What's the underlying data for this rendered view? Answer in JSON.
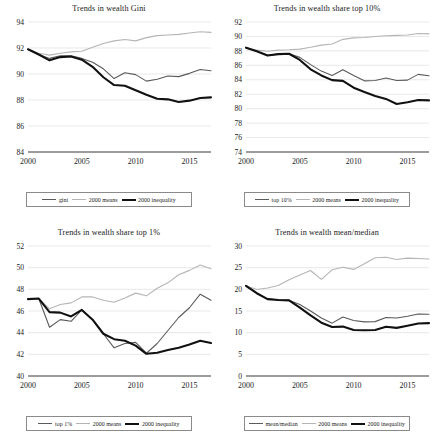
{
  "figure": {
    "width": 436,
    "height": 448,
    "background": "#ffffff",
    "layout": "2x2-grid-of-line-charts"
  },
  "styles": {
    "series_color": "#5a5a5a",
    "means_color": "#b5b5b5",
    "inequality_color": "#111111",
    "grid_color": "#d9d9d9",
    "axis_color": "#3a3a3a",
    "legend_border": "#8a8a8a"
  },
  "charts": [
    {
      "id": "wealth-gini",
      "type": "line",
      "title": "Trends in wealth Gini",
      "xlabel": "",
      "ylabel": "",
      "grid": true,
      "legend_position": "below-axis",
      "xlim": [
        2000,
        2017
      ],
      "ylim": [
        84,
        94
      ],
      "yticks": [
        84,
        86,
        88,
        90,
        92,
        94
      ],
      "xticks": [
        2000,
        2005,
        2010,
        2015
      ],
      "x": [
        2000,
        2001,
        2002,
        2003,
        2004,
        2005,
        2006,
        2007,
        2008,
        2009,
        2010,
        2011,
        2012,
        2013,
        2014,
        2015,
        2016,
        2017
      ],
      "series": [
        {
          "name": "gini",
          "color": "#5a5a5a",
          "width": 1.1,
          "values": [
            91.9,
            91.5,
            91.2,
            91.4,
            91.4,
            91.2,
            90.9,
            90.4,
            89.65,
            90.1,
            89.95,
            89.45,
            89.6,
            89.85,
            89.8,
            90.05,
            90.35,
            90.25
          ]
        },
        {
          "name": "2000 means",
          "color": "#b5b5b5",
          "width": 1.1,
          "values": [
            91.9,
            91.6,
            91.45,
            91.6,
            91.7,
            91.75,
            92.05,
            92.35,
            92.55,
            92.65,
            92.55,
            92.8,
            92.95,
            93.0,
            93.05,
            93.15,
            93.25,
            93.2
          ]
        },
        {
          "name": "2000 inequality",
          "color": "#111111",
          "width": 2.1,
          "values": [
            91.9,
            91.5,
            91.05,
            91.3,
            91.35,
            91.1,
            90.55,
            89.75,
            89.15,
            89.1,
            88.75,
            88.4,
            88.1,
            88.05,
            87.85,
            87.95,
            88.15,
            88.2
          ]
        }
      ],
      "legend": [
        "gini",
        "2000 means",
        "2000 inequality"
      ]
    },
    {
      "id": "wealth-share-top10",
      "type": "line",
      "title": "Trends in wealth share top 10%",
      "xlabel": "",
      "ylabel": "",
      "grid": true,
      "legend_position": "below-axis",
      "xlim": [
        2000,
        2017
      ],
      "ylim": [
        74,
        92
      ],
      "yticks": [
        74,
        76,
        78,
        80,
        82,
        84,
        86,
        88,
        90,
        92
      ],
      "xticks": [
        2000,
        2005,
        2010,
        2015
      ],
      "x": [
        2000,
        2001,
        2002,
        2003,
        2004,
        2005,
        2006,
        2007,
        2008,
        2009,
        2010,
        2011,
        2012,
        2013,
        2014,
        2015,
        2016,
        2017
      ],
      "series": [
        {
          "name": "top 10%",
          "color": "#5a5a5a",
          "width": 1.1,
          "values": [
            88.45,
            87.95,
            87.4,
            87.55,
            87.6,
            87.1,
            86.1,
            85.2,
            84.6,
            85.4,
            84.6,
            83.85,
            83.9,
            84.25,
            83.9,
            83.95,
            84.75,
            84.55
          ]
        },
        {
          "name": "2000 means",
          "color": "#b5b5b5",
          "width": 1.1,
          "values": [
            88.45,
            88.1,
            87.95,
            88.1,
            88.15,
            88.25,
            88.5,
            88.8,
            88.95,
            89.6,
            89.8,
            89.85,
            90.0,
            90.1,
            90.15,
            90.2,
            90.4,
            90.35
          ]
        },
        {
          "name": "2000 inequality",
          "color": "#111111",
          "width": 2.1,
          "values": [
            88.45,
            87.95,
            87.35,
            87.55,
            87.6,
            86.75,
            85.45,
            84.6,
            83.95,
            83.85,
            82.9,
            82.3,
            81.75,
            81.35,
            80.65,
            80.9,
            81.2,
            81.15
          ]
        }
      ],
      "legend": [
        "top 10%",
        "2000 means",
        "2000 inequality"
      ]
    },
    {
      "id": "wealth-share-top1",
      "type": "line",
      "title": "Trends in wealth share top 1%",
      "xlabel": "",
      "ylabel": "",
      "grid": true,
      "legend_position": "below-axis",
      "xlim": [
        2000,
        2017
      ],
      "ylim": [
        40,
        52
      ],
      "yticks": [
        40,
        42,
        44,
        46,
        48,
        50,
        52
      ],
      "xticks": [
        2000,
        2005,
        2010,
        2015
      ],
      "x": [
        2000,
        2001,
        2002,
        2003,
        2004,
        2005,
        2006,
        2007,
        2008,
        2009,
        2010,
        2011,
        2012,
        2013,
        2014,
        2015,
        2016,
        2017
      ],
      "series": [
        {
          "name": "top 1%",
          "color": "#5a5a5a",
          "width": 1.1,
          "values": [
            47.1,
            47.15,
            44.5,
            45.2,
            45.05,
            46.1,
            45.2,
            43.9,
            42.6,
            43.0,
            43.1,
            42.1,
            43.0,
            44.2,
            45.4,
            46.3,
            47.55,
            47.0
          ]
        },
        {
          "name": "2000 means",
          "color": "#b5b5b5",
          "width": 1.1,
          "values": [
            47.1,
            47.15,
            46.2,
            46.6,
            46.75,
            47.3,
            47.3,
            47.0,
            46.8,
            47.2,
            47.65,
            47.4,
            48.1,
            48.6,
            49.35,
            49.75,
            50.25,
            49.9
          ]
        },
        {
          "name": "2000 inequality",
          "color": "#111111",
          "width": 2.1,
          "values": [
            47.1,
            47.15,
            45.9,
            45.85,
            45.5,
            46.1,
            45.2,
            43.9,
            43.4,
            43.25,
            42.8,
            42.05,
            42.15,
            42.4,
            42.6,
            42.9,
            43.25,
            43.05
          ]
        }
      ],
      "legend": [
        "top 1%",
        "2000 means",
        "2000 inequality"
      ]
    },
    {
      "id": "wealth-mean-median",
      "type": "line",
      "title": "Trends in wealth mean/median",
      "xlabel": "",
      "ylabel": "",
      "grid": true,
      "legend_position": "below-axis",
      "xlim": [
        2000,
        2017
      ],
      "ylim": [
        0,
        30
      ],
      "yticks": [
        0,
        5,
        10,
        15,
        20,
        25,
        30
      ],
      "xticks": [
        2000,
        2005,
        2010,
        2015
      ],
      "x": [
        2000,
        2001,
        2002,
        2003,
        2004,
        2005,
        2006,
        2007,
        2008,
        2009,
        2010,
        2011,
        2012,
        2013,
        2014,
        2015,
        2016,
        2017
      ],
      "series": [
        {
          "name": "mean/median",
          "color": "#5a5a5a",
          "width": 1.1,
          "values": [
            20.8,
            19.1,
            17.8,
            17.6,
            17.5,
            16.5,
            15.0,
            13.4,
            12.2,
            13.6,
            12.8,
            12.5,
            12.55,
            13.5,
            13.4,
            13.8,
            14.3,
            14.25
          ]
        },
        {
          "name": "2000 means",
          "color": "#b5b5b5",
          "width": 1.1,
          "values": [
            20.8,
            19.95,
            20.3,
            20.9,
            22.2,
            23.3,
            24.35,
            22.3,
            24.5,
            25.1,
            24.6,
            25.9,
            27.3,
            27.4,
            26.9,
            27.2,
            27.1,
            27.0
          ]
        },
        {
          "name": "2000 inequality",
          "color": "#111111",
          "width": 2.1,
          "values": [
            20.8,
            19.1,
            17.75,
            17.55,
            17.45,
            15.8,
            14.0,
            12.3,
            11.3,
            11.4,
            10.6,
            10.55,
            10.6,
            11.35,
            11.1,
            11.6,
            12.1,
            12.2
          ]
        }
      ],
      "legend": [
        "mean/median",
        "2000 means",
        "2000 inequality"
      ]
    }
  ],
  "chart_data": {
    "type": "line",
    "panels": 4,
    "shared_x": [
      2000,
      2001,
      2002,
      2003,
      2004,
      2005,
      2006,
      2007,
      2008,
      2009,
      2010,
      2011,
      2012,
      2013,
      2014,
      2015,
      2016,
      2017
    ],
    "shared_xticks": [
      2000,
      2005,
      2010,
      2015
    ],
    "common_series_names": [
      "actual",
      "2000 means",
      "2000 inequality"
    ]
  }
}
